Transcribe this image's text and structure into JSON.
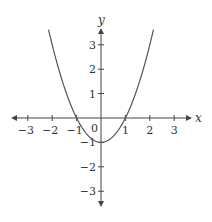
{
  "chart_data": {
    "type": "line",
    "title": "",
    "xlabel": "x",
    "ylabel": "y",
    "function": "y = x^2 - 1",
    "xlim": [
      -3.6,
      3.7
    ],
    "ylim": [
      -3.6,
      3.7
    ],
    "grid": false,
    "legend": null,
    "x_ticks": [
      -3,
      -2,
      -1,
      1,
      2,
      3
    ],
    "y_ticks": [
      -3,
      -2,
      -1,
      1,
      2,
      3
    ],
    "x_tick_labels": [
      "−3",
      "−2",
      "−1",
      "1",
      "2",
      "3"
    ],
    "y_tick_labels": [
      "−3",
      "−2",
      "−1",
      "1",
      "2",
      "3"
    ],
    "origin_label": "0",
    "series": [
      {
        "name": "parabola",
        "x": [
          -2.15,
          -2,
          -1.5,
          -1,
          -0.5,
          0,
          0.5,
          1,
          1.5,
          2,
          2.15
        ],
        "y": [
          3.62,
          3,
          1.25,
          0,
          -0.75,
          -1,
          -0.75,
          0,
          1.25,
          3,
          3.62
        ]
      }
    ],
    "key_points": {
      "vertex": [
        0,
        -1
      ],
      "x_intercepts": [
        -1,
        1
      ],
      "y_intercept": -1
    }
  },
  "colors": {
    "axis": "#444444",
    "curve": "#555555",
    "text": "#333333"
  }
}
